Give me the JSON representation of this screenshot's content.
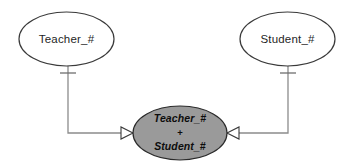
{
  "diagram": {
    "type": "entity-relationship-diagram",
    "background_color": "#ffffff",
    "entities": [
      {
        "id": "teacher",
        "label": "Teacher_#",
        "shape": "ellipse",
        "fill_color": "#ffffff",
        "stroke_color": "#3a3a3a",
        "cx": 66.5,
        "cy": 39,
        "rx": 47.5,
        "ry": 27
      },
      {
        "id": "student",
        "label": "Student_#",
        "shape": "ellipse",
        "fill_color": "#ffffff",
        "stroke_color": "#3a3a3a",
        "cx": 287.5,
        "cy": 39,
        "rx": 47.5,
        "ry": 27
      }
    ],
    "relationship": {
      "id": "teacher-student",
      "shape": "ellipse",
      "fill_color": "#9a9a9a",
      "stroke_color": "#2a2a2a",
      "cx": 180,
      "cy": 133,
      "rx": 47,
      "ry": 27,
      "line1": "Teacher_#",
      "operator": "+",
      "line2": "Student_#"
    },
    "connectors": [
      {
        "id": "teacher-to-relationship",
        "from": "teacher",
        "to": "relationship",
        "path": "M 68 66 L 68 133 L 133 133",
        "stroke_color": "#8c8c8c",
        "cardinality_marker": "one",
        "tick_label": "|",
        "tick_x1": 60,
        "tick_x2": 76,
        "tick_y": 73,
        "arrowhead": "open-triangle",
        "arrow_points": "133,133 121,127 121,139"
      },
      {
        "id": "student-to-relationship",
        "from": "student",
        "to": "relationship",
        "path": "M 288 66 L 288 133 L 227 133",
        "stroke_color": "#8c8c8c",
        "cardinality_marker": "one",
        "tick_label": "|",
        "tick_x1": 280,
        "tick_x2": 296,
        "tick_y": 73,
        "arrowhead": "open-triangle",
        "arrow_points": "227,133 239,127 239,139"
      }
    ]
  }
}
